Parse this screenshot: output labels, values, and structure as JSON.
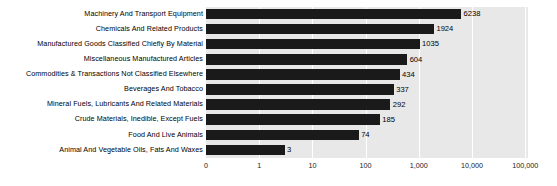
{
  "chart_data": {
    "type": "bar",
    "orientation": "horizontal",
    "title": "",
    "subtitle": "",
    "xlabel": "",
    "ylabel": "",
    "grid": true,
    "legend": null,
    "xscale": "log",
    "xlim": [
      0,
      100000
    ],
    "xticklabels": [
      "0",
      "1",
      "10",
      "100",
      "1,000",
      "10,000",
      "100,000"
    ],
    "xtickvalues": [
      0,
      1,
      10,
      100,
      1000,
      10000,
      100000
    ],
    "categories": [
      "Machinery And Transport Equipment",
      "Chemicals And Related Products",
      "Manufactured Goods Classified Chiefly By Material",
      "Miscellaneous Manufactured Articles",
      "Commodities & Transactions Not Classified Elsewhere",
      "Beverages And Tobacco",
      "Mineral Fuels, Lubricants And Related Materials",
      "Crude Materials, Inedible, Except Fuels",
      "Food And Live Animals",
      "Animal And Vegetable Oils, Fats And Waxes"
    ],
    "values": [
      6238,
      1924,
      1035,
      604,
      434,
      337,
      292,
      185,
      74,
      3
    ],
    "value_labels": [
      "6238",
      "1924",
      "1035",
      "604",
      "434",
      "337",
      "292",
      "185",
      "74",
      "3"
    ],
    "colors": {
      "bar": "#1a1a1a",
      "plot_background": "#e8e8e8",
      "figure_background": "#ffffff",
      "gridline": "#ffffff",
      "text": "#000000"
    }
  }
}
